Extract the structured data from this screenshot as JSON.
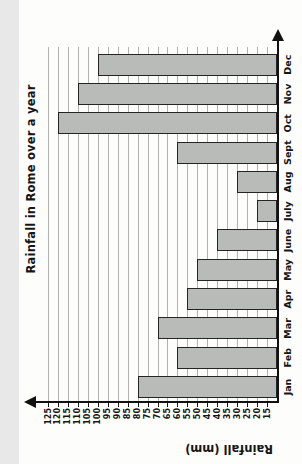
{
  "chart_data": {
    "type": "bar",
    "title": "Rainfall in Rome over a year",
    "ylabel": "Rainfall (mm)",
    "xlabel": "",
    "categories": [
      "Jan",
      "Feb",
      "Mar",
      "Apr",
      "May",
      "June",
      "July",
      "Aug",
      "Sept",
      "Oct",
      "Nov",
      "Dec"
    ],
    "values": [
      80,
      60,
      70,
      55,
      50,
      40,
      20,
      30,
      60,
      120,
      110,
      100
    ],
    "y_ticks": [
      15,
      20,
      25,
      30,
      35,
      40,
      45,
      50,
      55,
      60,
      65,
      70,
      75,
      80,
      85,
      90,
      95,
      100,
      105,
      110,
      115,
      120,
      125
    ],
    "ylim": [
      10,
      125
    ],
    "grid": "horizontal gridlines on, one per tick",
    "legend": "none",
    "orientation": "entire chart printed rotated 90 degrees counter-clockwise on a portrait page",
    "axes_arrows": "arrow at top of value axis and at right end of month axis",
    "bar_fill": "#b9bbb8",
    "bar_border": "#242424",
    "grid_color": "#b2b2b2",
    "axis_color": "#111111",
    "text_color": "#161616",
    "paper_color": "#fdfdfc"
  }
}
